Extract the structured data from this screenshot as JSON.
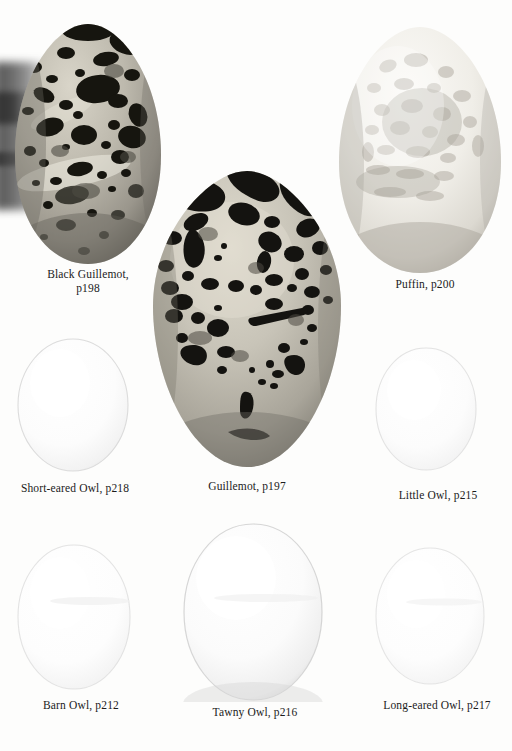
{
  "plate": {
    "background_color": "#fdfdfc",
    "kind": "book-plate-photograph",
    "subject": "bird eggs",
    "artifact_note": "dark blurred scan shadow along upper-left edge"
  },
  "specimens": [
    {
      "id": "black-guillemot",
      "label": "Black Guillemot,\np198",
      "species": "Black Guillemot",
      "page_ref": "p198",
      "shape": "pyriform",
      "ground_color": "#b9b5a9",
      "markings_color": "#16150f",
      "pattern": "heavy black blotches and spots",
      "box": {
        "x": 14,
        "y": 23,
        "w": 148,
        "h": 242
      },
      "caption_box": {
        "x": 8,
        "y": 268,
        "w": 160
      }
    },
    {
      "id": "puffin",
      "label": "Puffin, p200",
      "species": "Puffin",
      "page_ref": "p200",
      "shape": "pyriform",
      "ground_color": "#eceae4",
      "markings_color": "#b9b4ab",
      "pattern": "faint grey mottling and suffused blotches",
      "box": {
        "x": 338,
        "y": 26,
        "w": 164,
        "h": 248
      },
      "caption_box": {
        "x": 340,
        "y": 278,
        "w": 170
      }
    },
    {
      "id": "guillemot",
      "label": "Guillemot, p197",
      "species": "Guillemot",
      "page_ref": "p197",
      "shape": "pyriform",
      "ground_color": "#c3bfb3",
      "markings_color": "#141310",
      "pattern": "bold black scrawls, blotches and spots",
      "box": {
        "x": 152,
        "y": 170,
        "w": 190,
        "h": 298
      },
      "caption_box": {
        "x": 162,
        "y": 480,
        "w": 170
      }
    },
    {
      "id": "short-eared-owl",
      "label": "Short-eared Owl, p218",
      "species": "Short-eared Owl",
      "page_ref": "p218",
      "shape": "oval",
      "ground_color": "#fafafa",
      "markings_color": "#e8e8e8",
      "pattern": "plain white, unmarked",
      "box": {
        "x": 16,
        "y": 337,
        "w": 114,
        "h": 136
      },
      "caption_box": {
        "x": 2,
        "y": 482,
        "w": 146
      }
    },
    {
      "id": "little-owl",
      "label": "Little Owl, p215",
      "species": "Little Owl",
      "page_ref": "p215",
      "shape": "oval",
      "ground_color": "#fbfbfb",
      "markings_color": "#ededed",
      "pattern": "plain white, unmarked",
      "box": {
        "x": 374,
        "y": 346,
        "w": 104,
        "h": 126
      },
      "caption_box": {
        "x": 372,
        "y": 489,
        "w": 132
      }
    },
    {
      "id": "barn-owl",
      "label": "Barn Owl, p212",
      "species": "Barn Owl",
      "page_ref": "p212",
      "shape": "elongated oval",
      "ground_color": "#fbfbfb",
      "markings_color": "#ececec",
      "pattern": "plain white, unmarked",
      "box": {
        "x": 16,
        "y": 543,
        "w": 116,
        "h": 148
      },
      "caption_box": {
        "x": 8,
        "y": 699,
        "w": 146
      }
    },
    {
      "id": "tawny-owl",
      "label": "Tawny Owl, p216",
      "species": "Tawny Owl",
      "page_ref": "p216",
      "shape": "broad rounded oval",
      "ground_color": "#fafafa",
      "markings_color": "#e4e4e4",
      "pattern": "plain white, unmarked",
      "box": {
        "x": 182,
        "y": 522,
        "w": 142,
        "h": 180
      },
      "caption_box": {
        "x": 180,
        "y": 706,
        "w": 150
      }
    },
    {
      "id": "long-eared-owl",
      "label": "Long-eared Owl, p217",
      "species": "Long-eared Owl",
      "page_ref": "p217",
      "shape": "oval",
      "ground_color": "#fcfcfc",
      "markings_color": "#ededed",
      "pattern": "plain white, unmarked",
      "box": {
        "x": 374,
        "y": 546,
        "w": 112,
        "h": 140
      },
      "caption_box": {
        "x": 362,
        "y": 699,
        "w": 150
      }
    }
  ]
}
